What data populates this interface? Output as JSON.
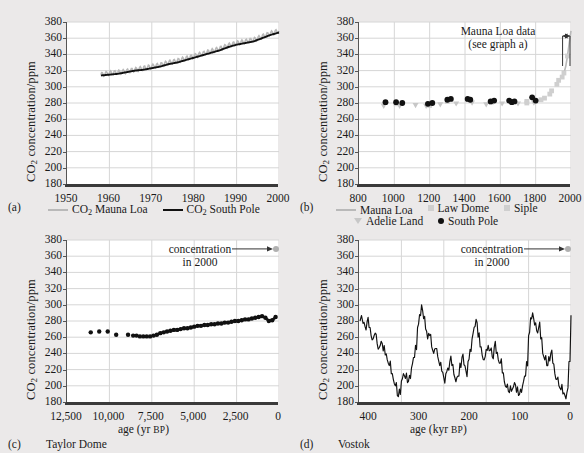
{
  "figure": {
    "background": "#ebe9e9",
    "y_axis_label_prefix": "CO",
    "y_axis_label_suffix": " concentration/ppm",
    "y_ticks": [
      180,
      200,
      220,
      240,
      260,
      280,
      300,
      320,
      340,
      360,
      380
    ],
    "series_colors": {
      "mauna_loa": "#b9b9b9",
      "south_pole": "#111111",
      "law_dome": "#cfcfcf",
      "siple": "#cfcfcf",
      "adelie_land": "#c7c7c7",
      "vostok": "#111111",
      "taylor_dome": "#111111",
      "marker_2000": "#b0b0b0"
    }
  },
  "panels": [
    {
      "letter": "(a)",
      "name": "",
      "x_ticks": [
        "1950",
        "1960",
        "1970",
        "1980",
        "1990",
        "2000"
      ],
      "x_label": "",
      "legend": [
        {
          "label_prefix": "CO",
          "label_suffix": " Mauna Loa",
          "marker": "line-gray"
        },
        {
          "label_prefix": "CO",
          "label_suffix": " South Pole",
          "marker": "line-black"
        }
      ]
    },
    {
      "letter": "(b)",
      "name": "",
      "x_ticks": [
        "800",
        "1000",
        "1200",
        "1400",
        "1600",
        "1800",
        "2000"
      ],
      "x_label": "",
      "annotation_line1": "Mauna Loa data",
      "annotation_line2": "(see graph a)",
      "legend": [
        {
          "label": "Mauna Loa",
          "marker": "line-gray"
        },
        {
          "label": "Law Dome",
          "marker": "square-gray"
        },
        {
          "label": "Siple",
          "marker": "square-gray"
        },
        {
          "label": "Adelie Land",
          "marker": "triangle-gray"
        },
        {
          "label": "South Pole",
          "marker": "dot-black"
        }
      ]
    },
    {
      "letter": "(c)",
      "name": "Taylor Dome",
      "x_ticks": [
        "12,500",
        "10,000",
        "7,500",
        "5,000",
        "2,500",
        "0"
      ],
      "x_label_main": "age (yr ",
      "x_label_sc": "BP",
      "x_label_end": ")",
      "annotation_line1": "concentration",
      "annotation_line2": "in 2000"
    },
    {
      "letter": "(d)",
      "name": "Vostok",
      "x_ticks": [
        "400",
        "300",
        "200",
        "100",
        "0"
      ],
      "x_label_main": "age (kyr ",
      "x_label_sc": "BP",
      "x_label_end": ")",
      "annotation_line1": "concentration",
      "annotation_line2": "in 2000"
    }
  ],
  "chart_data": [
    {
      "type": "line",
      "panel": "a",
      "title": "CO2 concentration at Mauna Loa and South Pole, 1950-2000",
      "xlabel": "year",
      "ylabel": "CO2 concentration/ppm",
      "xlim": [
        1950,
        2000
      ],
      "ylim": [
        180,
        380
      ],
      "grid": true,
      "legend_position": "below",
      "series": [
        {
          "name": "CO2 Mauna Loa",
          "color": "#b9b9b9",
          "note": "monthly record with seasonal sawtooth, plotted slightly above South Pole",
          "x": [
            1958,
            1960,
            1962,
            1964,
            1966,
            1968,
            1970,
            1972,
            1974,
            1976,
            1978,
            1980,
            1982,
            1984,
            1986,
            1988,
            1990,
            1992,
            1994,
            1996,
            1998,
            2000
          ],
          "values": [
            315,
            317,
            318,
            319,
            321,
            323,
            325,
            327,
            330,
            332,
            335,
            338,
            341,
            344,
            347,
            351,
            354,
            356,
            358,
            362,
            366,
            369
          ]
        },
        {
          "name": "CO2 South Pole",
          "color": "#111111",
          "x": [
            1958,
            1960,
            1962,
            1964,
            1966,
            1968,
            1970,
            1972,
            1974,
            1976,
            1978,
            1980,
            1982,
            1984,
            1986,
            1988,
            1990,
            1992,
            1994,
            1996,
            1998,
            2000
          ],
          "values": [
            314,
            315,
            316,
            318,
            320,
            321,
            323,
            325,
            328,
            330,
            333,
            336,
            339,
            342,
            345,
            349,
            352,
            354,
            356,
            360,
            364,
            367
          ]
        }
      ]
    },
    {
      "type": "scatter",
      "panel": "b",
      "title": "CO2 concentration over the last millennium",
      "xlabel": "year",
      "ylabel": "CO2 concentration/ppm",
      "xlim": [
        800,
        2000
      ],
      "ylim": [
        180,
        380
      ],
      "grid": true,
      "legend_position": "below",
      "annotations": [
        "Mauna Loa data (see graph a)"
      ],
      "series": [
        {
          "name": "South Pole",
          "color": "#111111",
          "marker": "circle",
          "x": [
            950,
            1010,
            1045,
            1190,
            1215,
            1300,
            1320,
            1415,
            1430,
            1545,
            1565,
            1650,
            1665,
            1680,
            1780,
            1800
          ],
          "values": [
            281,
            281,
            280,
            279,
            280,
            284,
            285,
            285,
            284,
            282,
            283,
            283,
            281,
            282,
            287,
            283
          ]
        },
        {
          "name": "Law Dome",
          "color": "#cfcfcf",
          "marker": "square",
          "x": [
            1010,
            1200,
            1300,
            1420,
            1550,
            1660,
            1750,
            1830,
            1880,
            1920,
            1950
          ],
          "values": [
            279,
            277,
            282,
            284,
            281,
            282,
            282,
            284,
            291,
            303,
            312
          ]
        },
        {
          "name": "Siple",
          "color": "#cfcfcf",
          "marker": "square",
          "x": [
            1750,
            1800,
            1850,
            1890,
            1930,
            1960,
            1980
          ],
          "values": [
            280,
            282,
            286,
            295,
            308,
            317,
            338
          ]
        },
        {
          "name": "Adelie Land",
          "color": "#c7c7c7",
          "marker": "triangle",
          "x": [
            940,
            1030,
            1120,
            1180,
            1260,
            1350,
            1440,
            1520,
            1610,
            1700,
            1790
          ],
          "values": [
            276,
            276,
            277,
            276,
            278,
            279,
            280,
            278,
            279,
            279,
            280
          ]
        },
        {
          "name": "Mauna Loa",
          "color": "#b9b9b9",
          "marker": "line",
          "x": [
            1958,
            1970,
            1980,
            1990,
            2000
          ],
          "values": [
            315,
            325,
            338,
            354,
            369
          ]
        }
      ]
    },
    {
      "type": "scatter",
      "panel": "c",
      "title": "Taylor Dome CO2 record through the Holocene",
      "xlabel": "age (yr BP)",
      "ylabel": "CO2 concentration/ppm",
      "xlim": [
        12500,
        0
      ],
      "ylim": [
        180,
        380
      ],
      "x_reversed": true,
      "grid": true,
      "annotations": [
        "concentration in 2000"
      ],
      "marker_2000_value": 369,
      "series": [
        {
          "name": "Taylor Dome",
          "color": "#111111",
          "marker": "circle",
          "x": [
            11100,
            10600,
            10100,
            9600,
            8900,
            8600,
            8400,
            8200,
            8000,
            7800,
            7600,
            7400,
            7200,
            7000,
            6800,
            6600,
            6400,
            6200,
            6000,
            5800,
            5600,
            5400,
            5200,
            5000,
            4800,
            4600,
            4400,
            4200,
            4000,
            3800,
            3600,
            3400,
            3200,
            3000,
            2800,
            2600,
            2400,
            2200,
            2000,
            1800,
            1600,
            1400,
            1200,
            1000,
            800,
            600,
            400,
            200
          ],
          "values": [
            266,
            267,
            267,
            263,
            263,
            262,
            262,
            261,
            261,
            261,
            261,
            262,
            263,
            265,
            266,
            267,
            268,
            269,
            269,
            270,
            271,
            271,
            272,
            273,
            274,
            274,
            275,
            275,
            276,
            276,
            277,
            277,
            278,
            278,
            279,
            280,
            280,
            281,
            282,
            282,
            283,
            284,
            285,
            286,
            284,
            280,
            281,
            285
          ]
        }
      ]
    },
    {
      "type": "line",
      "panel": "d",
      "title": "Vostok ice core CO2 record over the last 420,000 years",
      "xlabel": "age (kyr BP)",
      "ylabel": "CO2 concentration/ppm",
      "xlim": [
        420,
        0
      ],
      "ylim": [
        180,
        380
      ],
      "x_reversed": true,
      "grid": true,
      "annotations": [
        "concentration in 2000"
      ],
      "marker_2000_value": 369,
      "series": [
        {
          "name": "Vostok",
          "color": "#111111",
          "x": [
            418,
            412,
            408,
            404,
            400,
            396,
            392,
            388,
            384,
            380,
            376,
            372,
            368,
            364,
            360,
            356,
            352,
            348,
            344,
            340,
            336,
            332,
            328,
            324,
            320,
            316,
            312,
            308,
            304,
            300,
            296,
            292,
            288,
            284,
            280,
            276,
            272,
            268,
            264,
            260,
            256,
            252,
            248,
            244,
            240,
            236,
            232,
            228,
            224,
            220,
            216,
            212,
            208,
            204,
            200,
            196,
            192,
            188,
            184,
            180,
            176,
            172,
            168,
            164,
            160,
            156,
            152,
            148,
            144,
            140,
            136,
            132,
            128,
            124,
            120,
            116,
            112,
            108,
            104,
            100,
            96,
            92,
            88,
            84,
            80,
            76,
            72,
            68,
            64,
            60,
            56,
            52,
            48,
            44,
            40,
            36,
            32,
            28,
            24,
            20,
            16,
            12,
            8,
            4,
            0
          ],
          "values": [
            280,
            277,
            273,
            279,
            272,
            262,
            258,
            265,
            252,
            247,
            255,
            243,
            238,
            232,
            225,
            215,
            208,
            200,
            188,
            196,
            206,
            215,
            209,
            204,
            213,
            222,
            235,
            250,
            272,
            288,
            300,
            283,
            270,
            258,
            262,
            248,
            240,
            246,
            236,
            225,
            218,
            210,
            215,
            222,
            230,
            225,
            214,
            205,
            212,
            228,
            235,
            226,
            218,
            230,
            245,
            258,
            272,
            282,
            260,
            248,
            238,
            232,
            245,
            250,
            244,
            236,
            248,
            240,
            232,
            228,
            216,
            205,
            198,
            193,
            200,
            196,
            204,
            192,
            188,
            196,
            200,
            212,
            230,
            262,
            284,
            290,
            275,
            268,
            272,
            258,
            240,
            232,
            225,
            236,
            240,
            228,
            215,
            208,
            200,
            195,
            190,
            188,
            192,
            230,
            287
          ]
        }
      ]
    }
  ]
}
